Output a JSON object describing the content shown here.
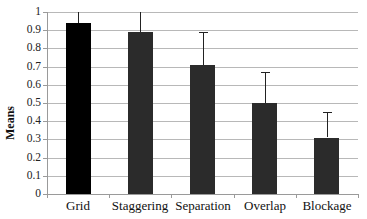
{
  "chart_data": {
    "type": "bar",
    "title": "",
    "xlabel": "",
    "ylabel": "Means",
    "ylim": [
      0,
      1
    ],
    "yticks": [
      "0",
      "0.1",
      "0.2",
      "0.3",
      "0.4",
      "0.5",
      "0.6",
      "0.7",
      "0.8",
      "0.9",
      "1"
    ],
    "grid": true,
    "legend": null,
    "categories": [
      "Grid",
      "Staggering",
      "Separation",
      "Overlap",
      "Blockage"
    ],
    "values": [
      0.94,
      0.89,
      0.71,
      0.5,
      0.31
    ],
    "error_upper": [
      1.0,
      1.0,
      0.89,
      0.67,
      0.45
    ],
    "colors": [
      "#000000",
      "#2b2b2b",
      "#2b2b2b",
      "#2b2b2b",
      "#2b2b2b"
    ]
  },
  "labels": {
    "ylabel": "Means"
  }
}
